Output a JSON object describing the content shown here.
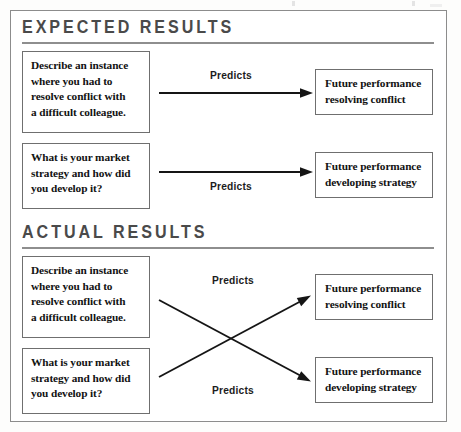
{
  "figure": {
    "accent_color": "#4a4a4a",
    "rule_color": "#8e8e8e",
    "box_border_color": "#6f6f6f",
    "arrow_color": "#151515"
  },
  "sections": [
    {
      "id": "expected",
      "title": "EXPECTED RESULTS",
      "questions": [
        {
          "id": "conflict-question",
          "lines": [
            "Describe an instance",
            "where you had to",
            "resolve conflict with",
            "a difficult colleague."
          ]
        },
        {
          "id": "strategy-question",
          "lines": [
            "What is your market",
            "strategy and how did",
            "you develop it?"
          ]
        }
      ],
      "outcomes": [
        {
          "id": "conflict-outcome",
          "lines": [
            "Future performance",
            "resolving conflict"
          ]
        },
        {
          "id": "strategy-outcome",
          "lines": [
            "Future performance",
            "developing strategy"
          ]
        }
      ],
      "relations": [
        {
          "label": "Predicts",
          "from": "conflict-question",
          "to": "conflict-outcome"
        },
        {
          "label": "Predicts",
          "from": "strategy-question",
          "to": "strategy-outcome"
        }
      ]
    },
    {
      "id": "actual",
      "title": "ACTUAL RESULTS",
      "questions": [
        {
          "id": "conflict-question",
          "lines": [
            "Describe an instance",
            "where you had to",
            "resolve conflict with",
            "a difficult colleague."
          ]
        },
        {
          "id": "strategy-question",
          "lines": [
            "What is your market",
            "strategy and how did",
            "you develop it?"
          ]
        }
      ],
      "outcomes": [
        {
          "id": "conflict-outcome",
          "lines": [
            "Future performance",
            "resolving conflict"
          ]
        },
        {
          "id": "strategy-outcome",
          "lines": [
            "Future performance",
            "developing strategy"
          ]
        }
      ],
      "relations": [
        {
          "label": "Predicts",
          "from": "conflict-question",
          "to": "strategy-outcome"
        },
        {
          "label": "Predicts",
          "from": "strategy-question",
          "to": "conflict-outcome"
        }
      ]
    }
  ]
}
